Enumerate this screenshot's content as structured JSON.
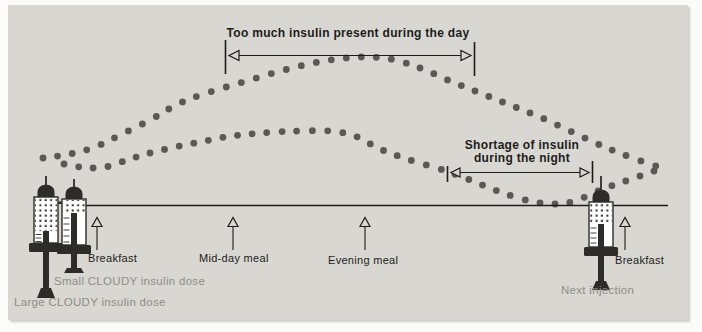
{
  "colors": {
    "page_bg": "#fbfbfa",
    "panel_bg": "#d8d7d2",
    "ink": "#1d1c1a",
    "dot": "#5b5955",
    "muted_label": "#8f8d88",
    "syringe_dark": "#2e2c29"
  },
  "annotations": {
    "day": {
      "label": "Too much insulin present during the day"
    },
    "night": {
      "label_line1": "Shortage of insulin",
      "label_line2": "during the night"
    }
  },
  "timeline": {
    "meals": [
      {
        "label": "Breakfast"
      },
      {
        "label": "Mid-day meal"
      },
      {
        "label": "Evening meal"
      },
      {
        "label": "Breakfast"
      }
    ]
  },
  "syringes": {
    "large": {
      "label": "Large CLOUDY insulin dose"
    },
    "small": {
      "label": "Small CLOUDY insulin dose"
    },
    "next": {
      "label": "Next injection"
    }
  },
  "chart_data": {
    "type": "scatter",
    "legend_position": "none",
    "grid": false,
    "dot_radius": 3.4,
    "dot_spacing": 14.5,
    "dot_color": "#5b5955",
    "series": [
      {
        "name": "large-dose-insulin-curve",
        "points": [
          [
            43,
            158
          ],
          [
            70,
            154
          ],
          [
            95,
            147
          ],
          [
            120,
            135
          ],
          [
            150,
            120
          ],
          [
            180,
            103
          ],
          [
            210,
            92
          ],
          [
            240,
            83
          ],
          [
            270,
            74
          ],
          [
            300,
            66
          ],
          [
            330,
            60
          ],
          [
            360,
            57
          ],
          [
            390,
            59
          ],
          [
            420,
            68
          ],
          [
            450,
            81
          ],
          [
            480,
            93
          ],
          [
            510,
            105
          ],
          [
            540,
            117
          ],
          [
            570,
            131
          ],
          [
            600,
            145
          ],
          [
            630,
            157
          ],
          [
            665,
            169
          ]
        ]
      },
      {
        "name": "small-dose-insulin-curve",
        "points": [
          [
            64,
            164
          ],
          [
            80,
            167
          ],
          [
            95,
            168
          ],
          [
            110,
            166
          ],
          [
            127,
            160
          ],
          [
            150,
            153
          ],
          [
            175,
            147
          ],
          [
            200,
            142
          ],
          [
            225,
            137
          ],
          [
            250,
            134
          ],
          [
            275,
            132
          ],
          [
            300,
            131
          ],
          [
            330,
            131
          ],
          [
            355,
            136
          ],
          [
            380,
            149
          ],
          [
            410,
            160
          ],
          [
            440,
            169
          ],
          [
            470,
            180
          ],
          [
            500,
            192
          ],
          [
            530,
            201
          ],
          [
            555,
            204
          ],
          [
            575,
            201
          ],
          [
            600,
            190
          ],
          [
            620,
            183
          ],
          [
            640,
            176
          ],
          [
            660,
            169
          ]
        ]
      }
    ]
  }
}
